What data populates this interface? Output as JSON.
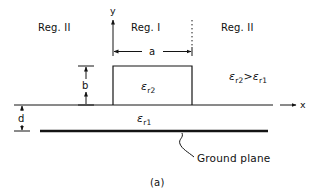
{
  "figure": {
    "caption": "(a)",
    "axes": {
      "x_label": "x",
      "y_label": "y"
    },
    "regions": {
      "left_label": "Reg. II",
      "center_label": "Reg. I",
      "right_label": "Reg. II"
    },
    "dimensions": {
      "width_label": "a",
      "height_label": "b",
      "substrate_thickness_label": "d"
    },
    "materials": {
      "strip_permittivity": "ε",
      "strip_permittivity_sub": "r2",
      "substrate_permittivity": "ε",
      "substrate_permittivity_sub": "r1"
    },
    "inequality": {
      "left_symbol": "ε",
      "left_sub": "r2",
      "operator": ">",
      "right_symbol": "ε",
      "right_sub": "r1",
      "full_text": "εr2 > εr1"
    },
    "annotations": {
      "ground_plane_label": "Ground plane"
    },
    "colors": {
      "ink": "#141414",
      "background": "#ffffff"
    }
  }
}
